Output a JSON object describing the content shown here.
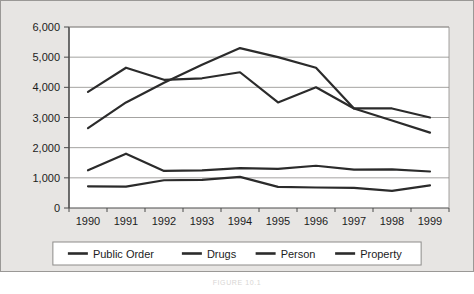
{
  "caption": "FIGURE 10.1",
  "colors": {
    "panel_background": "#e7e5e3",
    "plot_background": "#ffffff",
    "grid": "#8d8b89",
    "axis": "#4a4a4a",
    "series": "#2b2b2b",
    "text": "#1c1c1c",
    "legend_border": "#8d8b89"
  },
  "chart_data": {
    "type": "line",
    "title": "",
    "xlabel": "",
    "ylabel": "",
    "categories": [
      "1990",
      "1991",
      "1992",
      "1993",
      "1994",
      "1995",
      "1996",
      "1997",
      "1998",
      "1999"
    ],
    "ylim": [
      0,
      6000
    ],
    "ytick_labels": [
      "0",
      "1,000",
      "2,000",
      "3,000",
      "4,000",
      "5,000",
      "6,000"
    ],
    "ytick_values": [
      0,
      1000,
      2000,
      3000,
      4000,
      5000,
      6000
    ],
    "grid": true,
    "legend_position": "bottom",
    "series": [
      {
        "name": "Public Order",
        "values": [
          3850,
          4650,
          4250,
          4300,
          4500,
          3500,
          4000,
          3300,
          3300,
          3000
        ]
      },
      {
        "name": "Drugs",
        "values": [
          2650,
          3500,
          4150,
          4750,
          5300,
          5000,
          4650,
          3300,
          2900,
          2500
        ]
      },
      {
        "name": "Person",
        "values": [
          1250,
          1800,
          1230,
          1250,
          1320,
          1300,
          1400,
          1270,
          1280,
          1210
        ]
      },
      {
        "name": "Property",
        "values": [
          720,
          710,
          920,
          930,
          1030,
          700,
          680,
          670,
          570,
          750
        ]
      }
    ]
  },
  "legend": {
    "items": [
      {
        "label": "Public Order"
      },
      {
        "label": "Drugs"
      },
      {
        "label": "Person"
      },
      {
        "label": "Property"
      }
    ]
  }
}
